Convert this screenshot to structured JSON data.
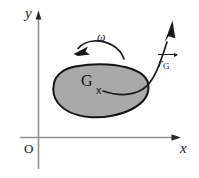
{
  "figure": {
    "background_color": "#ffffff"
  },
  "axes": {
    "x_label": "x",
    "y_label": "y",
    "origin_label": "O",
    "color": "#8c8c8c",
    "arrow_color": "#1a1a1a",
    "x_axis": {
      "y": 137,
      "x_start": 20,
      "x_end": 181
    },
    "y_axis": {
      "x": 38,
      "y_start": 12,
      "y_end": 169
    }
  },
  "body": {
    "name": "rigid-body-blob",
    "fill_color": "#a9a9a9",
    "stroke_color": "#1a1a1a",
    "centroid_label": "G",
    "point_marker": "x"
  },
  "annotations": {
    "angular_velocity": {
      "symbol": "ω",
      "direction": "counterclockwise",
      "arc_color": "#1a1a1a"
    },
    "position_vector": {
      "symbol_base": "r",
      "symbol_subscript": "G",
      "has_overarrow": true,
      "color": "#1a1a1a"
    }
  }
}
